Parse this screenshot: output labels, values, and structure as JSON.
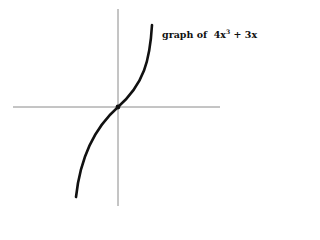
{
  "diagram": {
    "label_prefix": "graph of",
    "label_expr_coef": "4x",
    "label_expr_exp": "3",
    "label_expr_rest": "+ 3x",
    "function": "4x^3 + 3x",
    "colors": {
      "axis": "#8a8a8a",
      "curve": "#111111",
      "background": "#ffffff"
    }
  }
}
